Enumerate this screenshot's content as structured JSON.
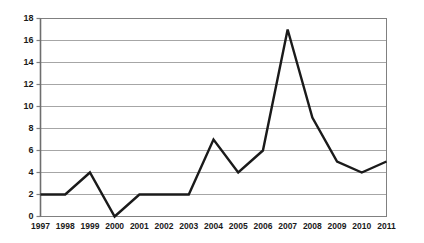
{
  "chart_data": {
    "type": "line",
    "title": "",
    "xlabel": "",
    "ylabel": "",
    "categories": [
      "1997",
      "1998",
      "1999",
      "2000",
      "2001",
      "2002",
      "2003",
      "2004",
      "2005",
      "2006",
      "2007",
      "2008",
      "2009",
      "2010",
      "2011"
    ],
    "values": [
      2,
      2,
      4,
      0,
      2,
      2,
      2,
      7,
      4,
      6,
      17,
      9,
      5,
      4,
      5
    ],
    "series": [
      {
        "name": "",
        "values": [
          2,
          2,
          4,
          0,
          2,
          2,
          2,
          7,
          4,
          6,
          17,
          9,
          5,
          4,
          5
        ]
      }
    ],
    "ylim": [
      0,
      18
    ],
    "ytick_values": [
      0,
      2,
      4,
      6,
      8,
      10,
      12,
      14,
      16,
      18
    ],
    "ytick_labels": [
      "0",
      "2",
      "4",
      "6",
      "8",
      "10",
      "12",
      "14",
      "16",
      "18"
    ],
    "xtick_labels": [
      "1997",
      "1998",
      "1999",
      "2000",
      "2001",
      "2002",
      "2003",
      "2004",
      "2005",
      "2006",
      "2007",
      "2008",
      "2009",
      "2010",
      "2011"
    ],
    "grid": {
      "horizontal": true,
      "vertical": false
    },
    "legend": {
      "visible": false,
      "position": "none",
      "entries": []
    },
    "annotations": [],
    "colors": {
      "line": "#1a1a1a",
      "gridline": "#a6a6a6",
      "axis": "#808080",
      "plot_background": "#ffffff",
      "page_background": "#ffffff",
      "tick_label": "#1a1a1a"
    },
    "style": {
      "line_width": 2.4,
      "markers": "none",
      "plot_border": true
    }
  }
}
